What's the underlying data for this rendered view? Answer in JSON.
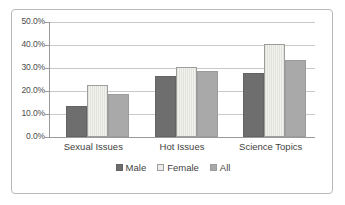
{
  "chart_data": {
    "type": "bar",
    "title": "",
    "subtitle": "",
    "xlabel": "",
    "ylabel": "",
    "categories": [
      "Sexual Issues",
      "Hot Issues",
      "Science Topics"
    ],
    "series": [
      {
        "name": "Male",
        "color": "#6e6e6e",
        "values": [
          13.5,
          26.5,
          28.0
        ]
      },
      {
        "name": "Female",
        "color": "#e9e9e4",
        "values": [
          22.5,
          30.5,
          40.5
        ]
      },
      {
        "name": "All",
        "color": "#a9a9a9",
        "values": [
          18.5,
          28.5,
          33.5
        ]
      }
    ],
    "ylim": [
      0,
      50
    ],
    "ytick_labels": [
      "50.0%",
      "40.0%",
      "30.0%",
      "20.0%",
      "10.0%",
      "0.0%"
    ],
    "ytick_values": [
      50,
      40,
      30,
      20,
      10,
      0
    ],
    "grid": true,
    "legend_position": "bottom",
    "value_suffix": "%"
  }
}
